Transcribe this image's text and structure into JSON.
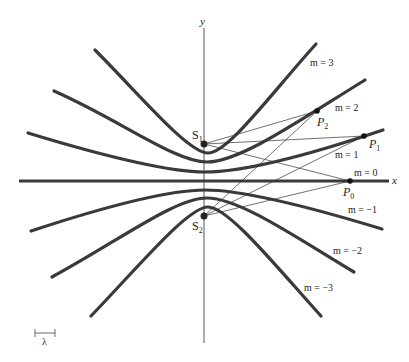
{
  "diagram": {
    "axes": {
      "x_label": "x",
      "y_label": "y"
    },
    "sources": [
      {
        "id": "S1",
        "label": "S",
        "sub": "1",
        "x": 204,
        "y": 144
      },
      {
        "id": "S2",
        "label": "S",
        "sub": "2",
        "x": 204,
        "y": 216
      }
    ],
    "points": [
      {
        "id": "P0",
        "label": "P",
        "sub": "0",
        "x": 350,
        "y": 181
      },
      {
        "id": "P1",
        "label": "P",
        "sub": "1",
        "x": 364,
        "y": 136
      },
      {
        "id": "P2",
        "label": "P",
        "sub": "2",
        "x": 317,
        "y": 111
      }
    ],
    "curves": [
      {
        "m": "3",
        "label": "m = 3"
      },
      {
        "m": "2",
        "label": "m = 2"
      },
      {
        "m": "1",
        "label": "m = 1"
      },
      {
        "m": "0",
        "label": "m = 0"
      },
      {
        "m": "-1",
        "label": "m = −1"
      },
      {
        "m": "-2",
        "label": "m = −2"
      },
      {
        "m": "-3",
        "label": "m = −3"
      }
    ],
    "scale_bar": {
      "label": "λ"
    },
    "colors": {
      "curve": "#3a3a3a",
      "axis": "#555555",
      "ray": "#333333",
      "background": "#ffffff"
    }
  }
}
